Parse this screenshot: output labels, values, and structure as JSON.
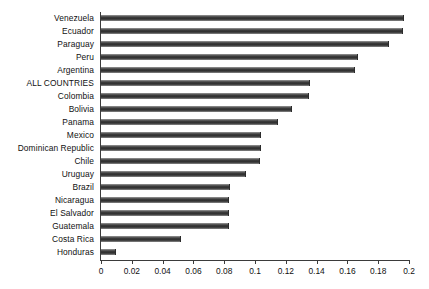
{
  "chart_data": {
    "type": "bar",
    "orientation": "horizontal",
    "title": "",
    "subtitle": "",
    "xlabel": "",
    "ylabel": "",
    "xlim": [
      0,
      0.2
    ],
    "xticks": [
      "0",
      "0.02",
      "0.04",
      "0.06",
      "0.08",
      "0.1",
      "0.12",
      "0.14",
      "0.16",
      "0.18",
      "0.2"
    ],
    "xtick_values": [
      0,
      0.02,
      0.04,
      0.06,
      0.08,
      0.1,
      0.12,
      0.14,
      0.16,
      0.18,
      0.2
    ],
    "grid": false,
    "legend": null,
    "bar_color": "#3d3d3d",
    "axis_color": "#3b3b3b",
    "categories": [
      "Venezuela",
      "Ecuador",
      "Paraguay",
      "Peru",
      "Argentina",
      "ALL COUNTRIES",
      "Colombia",
      "Bolivia",
      "Panama",
      "Mexico",
      "Dominican Republic",
      "Chile",
      "Uruguay",
      "Brazil",
      "Nicaragua",
      "El Salvador",
      "Guatemala",
      "Costa Rica",
      "Honduras"
    ],
    "values": [
      0.197,
      0.196,
      0.187,
      0.167,
      0.165,
      0.136,
      0.135,
      0.124,
      0.115,
      0.104,
      0.104,
      0.103,
      0.094,
      0.084,
      0.083,
      0.083,
      0.083,
      0.052,
      0.01
    ]
  }
}
